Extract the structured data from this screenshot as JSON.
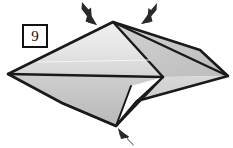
{
  "figure": {
    "kind": "origami-fold-step-diagram",
    "step_number": "9",
    "canvas": {
      "width": 233,
      "height": 148,
      "background": "#ffffff"
    },
    "palette": {
      "outline": "#1a1a1a",
      "fold_line": "#1a1a1a",
      "paper_light": "#e9e9e9",
      "paper_mid": "#c9c9c9",
      "paper_dark": "#b0b0b0",
      "paper_white": "#ffffff",
      "arrow_fill": "#2a2a2a"
    },
    "vertices": {
      "left_tip": "8,74",
      "right_tip": "228,76",
      "top_apex": "113,22",
      "bottom_apex": "116,126",
      "center_node": "163,77",
      "upper_right_bend": "200,50",
      "lower_left_bend": "62,103",
      "lower_inner": "137,101",
      "white_notch_top": "131,86"
    },
    "facets": [
      {
        "name": "upper-left-large-facet",
        "tone": "paper_light",
        "points": "8,74 113,22 163,77"
      },
      {
        "name": "upper-right-facet",
        "tone": "paper_mid",
        "points": "113,22 200,50 228,76 163,77"
      },
      {
        "name": "lower-left-facet",
        "tone": "paper_mid",
        "points": "8,74 163,77 116,126 62,103"
      },
      {
        "name": "lower-right-facet",
        "tone": "paper_mid",
        "points": "163,77 228,76 137,101 116,126"
      },
      {
        "name": "white-gusset-facet",
        "tone": "paper_white",
        "points": "163,77 137,101 116,126 131,86"
      }
    ],
    "fold_lines": [
      {
        "name": "apex-to-center-fold",
        "from": "113,22",
        "to": "163,77"
      },
      {
        "name": "horizontal-center-fold",
        "from": "8,74",
        "to": "163,77"
      },
      {
        "name": "center-to-bottom-fold",
        "from": "163,77",
        "to": "116,126"
      },
      {
        "name": "center-to-lower-inner-fold",
        "from": "163,77",
        "to": "137,101"
      },
      {
        "name": "lower-inner-to-bottom-fold",
        "from": "137,101",
        "to": "116,126"
      },
      {
        "name": "white-notch-vertical-fold",
        "from": "131,86",
        "to": "116,126"
      },
      {
        "name": "lower-left-bend-fold",
        "from": "62,103",
        "to": "116,126"
      },
      {
        "name": "upper-highlight-crease",
        "from": "36,61",
        "to": "150,61"
      }
    ],
    "arrows": [
      {
        "name": "arrow-top-left",
        "direction": "down-right",
        "tail": "82,2",
        "tip": "97,25",
        "meaning": "push/fold down at left of apex"
      },
      {
        "name": "arrow-top-right",
        "direction": "down-left",
        "tail": "157,3",
        "tip": "141,24",
        "meaning": "push/fold down at right of apex"
      },
      {
        "name": "arrow-bottom",
        "direction": "up-left",
        "tail": "134,146",
        "tip": "118,128",
        "meaning": "push/fold up at bottom point"
      }
    ]
  }
}
